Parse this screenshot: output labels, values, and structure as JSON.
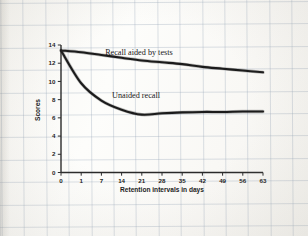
{
  "figure": {
    "background_color": "#f9f8f5",
    "ink_color": "#1b1b1b"
  },
  "chart_data": {
    "type": "line",
    "title": "",
    "xlabel": "Retention intervals in days",
    "ylabel": "Scores",
    "xlim": [
      0,
      63
    ],
    "ylim": [
      0,
      14
    ],
    "grid": true,
    "grid_style": "graph-paper background",
    "legend": "inline-labels",
    "x_tick_labels": [
      "0",
      "1",
      "7",
      "14",
      "21",
      "28",
      "35",
      "42",
      "49",
      "56",
      "63"
    ],
    "x_tick_values": [
      0,
      1,
      7,
      14,
      21,
      28,
      35,
      42,
      49,
      56,
      63
    ],
    "y_tick_labels": [
      "0",
      "2",
      "4",
      "6",
      "8",
      "10",
      "12",
      "14"
    ],
    "y_tick_values": [
      0,
      2,
      4,
      6,
      8,
      10,
      12,
      14
    ],
    "x": [
      0,
      1,
      7,
      14,
      21,
      28,
      35,
      42,
      49,
      56,
      63
    ],
    "series": [
      {
        "name": "Recall aided by tests",
        "label": "Recall aided by tests",
        "values": [
          13.4,
          13.2,
          12.9,
          12.6,
          12.3,
          12.1,
          11.9,
          11.6,
          11.4,
          11.2,
          11.0
        ],
        "color": "#1b1b1b"
      },
      {
        "name": "Unaided recall",
        "label": "Unaided recall",
        "values": [
          13.4,
          9.8,
          7.9,
          6.9,
          6.35,
          6.5,
          6.6,
          6.65,
          6.65,
          6.7,
          6.7
        ],
        "color": "#1b1b1b"
      }
    ],
    "annotations": [
      {
        "text": "Recall aided by tests",
        "x": 20,
        "y": 12.9
      },
      {
        "text": "Unaided recall",
        "x": 19,
        "y": 8.2
      }
    ]
  }
}
